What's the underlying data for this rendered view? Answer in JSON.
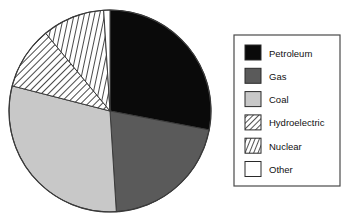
{
  "chart_data": {
    "type": "pie",
    "title": "",
    "xlabel": "",
    "ylabel": "",
    "legend_position": "right",
    "start_angle_deg": 0,
    "direction": "clockwise",
    "categories": [
      "Petroleum",
      "Gas",
      "Coal",
      "Hydroelectric",
      "Nuclear",
      "Other"
    ],
    "values": [
      28,
      21,
      30,
      10,
      10,
      1
    ],
    "series": [
      {
        "name": "Energy Sources",
        "values": [
          28,
          21,
          30,
          10,
          10,
          1
        ]
      }
    ],
    "slices": [
      {
        "label": "Petroleum",
        "value": 28,
        "fill": "#0a0a0a",
        "pattern": "solid",
        "start_deg": 0,
        "end_deg": 100.8
      },
      {
        "label": "Gas",
        "value": 21,
        "fill": "#5a5a5a",
        "pattern": "solid",
        "start_deg": 100.8,
        "end_deg": 176.4
      },
      {
        "label": "Coal",
        "value": 30,
        "fill": "#c8c8c8",
        "pattern": "solid",
        "start_deg": 176.4,
        "end_deg": 284.4
      },
      {
        "label": "Hydroelectric",
        "value": 10,
        "fill": "#ffffff",
        "pattern": "diagonal-hatch",
        "start_deg": 284.4,
        "end_deg": 320.4
      },
      {
        "label": "Nuclear",
        "value": 10,
        "fill": "#ffffff",
        "pattern": "steep-hatch",
        "start_deg": 320.4,
        "end_deg": 356.4
      },
      {
        "label": "Other",
        "value": 1,
        "fill": "#ffffff",
        "pattern": "none",
        "start_deg": 356.4,
        "end_deg": 360
      }
    ]
  },
  "pie": {
    "center_x": 110,
    "center_y": 111,
    "radius": 101,
    "outline_color": "#3a3a3a"
  },
  "legend": {
    "box": {
      "x": 234,
      "y": 35,
      "width": 106,
      "height": 151
    },
    "border_color": "#4a4a4a",
    "background": "#ffffff",
    "items": [
      {
        "label": "Petroleum",
        "swatch": "solid-black",
        "color": "#0a0a0a"
      },
      {
        "label": "Gas",
        "swatch": "solid-dark-gray",
        "color": "#5a5a5a"
      },
      {
        "label": "Coal",
        "swatch": "solid-light-gray",
        "color": "#c8c8c8"
      },
      {
        "label": "Hydroelectric",
        "swatch": "diagonal-hatch",
        "color": "#ffffff"
      },
      {
        "label": "Nuclear",
        "swatch": "steep-hatch",
        "color": "#ffffff"
      },
      {
        "label": "Other",
        "swatch": "white",
        "color": "#ffffff"
      }
    ]
  },
  "colors": {
    "petroleum": "#0a0a0a",
    "gas": "#5a5a5a",
    "coal": "#c8c8c8",
    "hatch_line": "#1a1a1a",
    "outline": "#3a3a3a",
    "text": "#111111",
    "background": "#ffffff"
  }
}
